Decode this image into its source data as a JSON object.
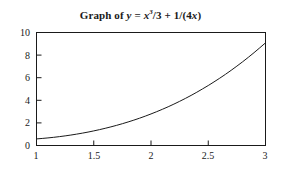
{
  "chart_data": {
    "type": "line",
    "title_parts": {
      "prefix": "Graph of",
      "lhs": "y",
      "equals": "=",
      "var1": "x",
      "exponent": "3",
      "frac1": "/3",
      "plus": "+",
      "term2": "1/(4",
      "var2": "x",
      "closeparen": ")"
    },
    "function": "y = x^3/3 + 1/(4x)",
    "xlabel": "",
    "ylabel": "",
    "xlim": [
      1,
      3
    ],
    "ylim": [
      0,
      10
    ],
    "xticks": [
      1,
      1.5,
      2,
      2.5,
      3
    ],
    "xtick_labels": [
      "1",
      "1.5",
      "2",
      "2.5",
      "3"
    ],
    "yticks": [
      0,
      2,
      4,
      6,
      8,
      10
    ],
    "ytick_labels": [
      "0",
      "2",
      "4",
      "6",
      "8",
      "10"
    ],
    "grid": false,
    "legend": false,
    "line_color": "#1a1a1a",
    "axis_color": "#1a1a1a",
    "background_color": "#ffffff",
    "x": [
      1.0,
      1.05,
      1.1,
      1.15,
      1.2,
      1.25,
      1.3,
      1.35,
      1.4,
      1.45,
      1.5,
      1.55,
      1.6,
      1.65,
      1.7,
      1.75,
      1.8,
      1.85,
      1.9,
      1.95,
      2.0,
      2.05,
      2.1,
      2.15,
      2.2,
      2.25,
      2.3,
      2.35,
      2.4,
      2.45,
      2.5,
      2.55,
      2.6,
      2.65,
      2.7,
      2.75,
      2.8,
      2.85,
      2.9,
      2.95,
      3.0
    ],
    "values": [
      0.583,
      0.624,
      0.671,
      0.724,
      0.784,
      0.851,
      0.924,
      1.005,
      1.093,
      1.188,
      1.292,
      1.403,
      1.522,
      1.649,
      1.785,
      1.929,
      2.083,
      2.245,
      2.417,
      2.598,
      2.792,
      2.994,
      3.206,
      3.427,
      3.662,
      3.908,
      4.164,
      4.432,
      4.713,
      5.008,
      5.308,
      5.627,
      5.953,
      6.296,
      6.653,
      7.025,
      7.406,
      7.804,
      8.217,
      8.646,
      9.083
    ]
  },
  "axis": {
    "ytick_0": "0",
    "ytick_1": "2",
    "ytick_2": "4",
    "ytick_3": "6",
    "ytick_4": "8",
    "ytick_5": "10",
    "xtick_0": "1",
    "xtick_1": "1.5",
    "xtick_2": "2",
    "xtick_3": "2.5",
    "xtick_4": "3"
  }
}
